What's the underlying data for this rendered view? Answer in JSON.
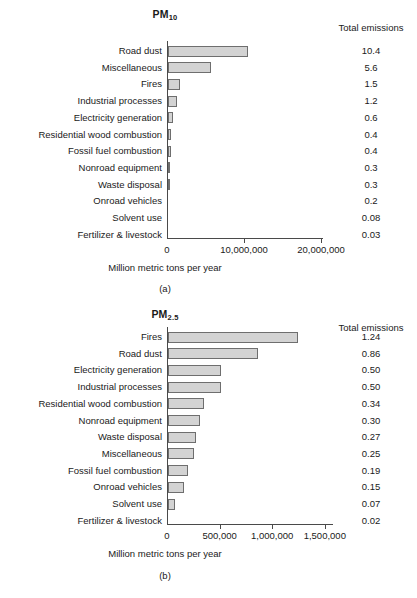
{
  "figure": {
    "panel_a_caption": "(a)",
    "panel_b_caption": "(b)",
    "emissions_column_header": "Total emissions",
    "axis_caption": "Million metric tons per year",
    "bar_fill": "#d3d3d3",
    "bar_stroke": "#6e6e6e",
    "axis_color": "#4a4a4a"
  },
  "chart_data": [
    {
      "type": "bar",
      "orientation": "horizontal",
      "title": "PM10",
      "title_main": "PM",
      "title_sub": "10",
      "panel": "(a)",
      "xlabel": "Million metric tons per year",
      "ylabel": "",
      "xlim": [
        0,
        23000000
      ],
      "xticks": [
        0,
        10000000,
        20000000
      ],
      "xticklabels": [
        "0",
        "10,000,000",
        "20,000,000"
      ],
      "grid": false,
      "legend": "none",
      "value_column_header": "Total emissions",
      "categories": [
        "Road dust",
        "Miscellaneous",
        "Fires",
        "Industrial processes",
        "Electricity generation",
        "Residential wood combustion",
        "Fossil fuel combustion",
        "Nonroad equipment",
        "Waste disposal",
        "Onroad vehicles",
        "Solvent use",
        "Fertilizer & livestock"
      ],
      "values": [
        10400000,
        5600000,
        1500000,
        1200000,
        600000,
        400000,
        400000,
        300000,
        300000,
        200000,
        80000,
        30000
      ],
      "value_labels": [
        "10.4",
        "5.6",
        "1.5",
        "1.2",
        "0.6",
        "0.4",
        "0.4",
        "0.3",
        "0.3",
        "0.2",
        "0.08",
        "0.03"
      ]
    },
    {
      "type": "bar",
      "orientation": "horizontal",
      "title": "PM2.5",
      "title_main": "PM",
      "title_sub": "2.5",
      "panel": "(b)",
      "xlabel": "Million metric tons per year",
      "ylabel": "",
      "xlim": [
        0,
        1700000
      ],
      "xticks": [
        0,
        500000,
        1000000,
        1500000
      ],
      "xticklabels": [
        "0",
        "500,000",
        "1,000,000",
        "1,500,000"
      ],
      "grid": false,
      "legend": "none",
      "value_column_header": "Total emissions",
      "categories": [
        "Fires",
        "Road dust",
        "Electricity generation",
        "Industrial processes",
        "Residential wood combustion",
        "Nonroad equipment",
        "Waste disposal",
        "Miscellaneous",
        "Fossil fuel combustion",
        "Onroad vehicles",
        "Solvent use",
        "Fertilizer & livestock"
      ],
      "values": [
        1240000,
        860000,
        500000,
        500000,
        340000,
        300000,
        270000,
        250000,
        190000,
        150000,
        70000,
        20000
      ],
      "value_labels": [
        "1.24",
        "0.86",
        "0.50",
        "0.50",
        "0.34",
        "0.30",
        "0.27",
        "0.25",
        "0.19",
        "0.15",
        "0.07",
        "0.02"
      ]
    }
  ]
}
